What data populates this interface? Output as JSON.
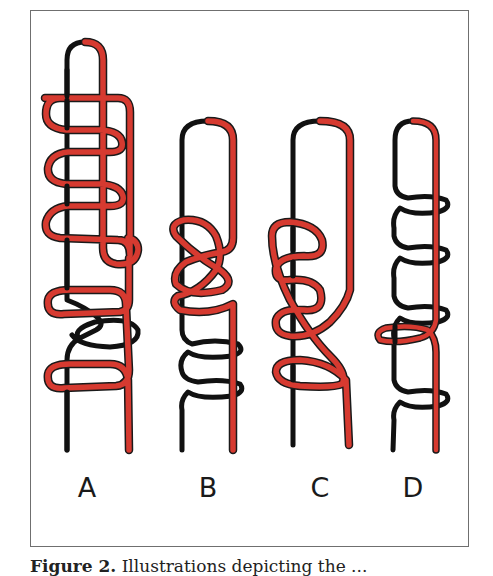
{
  "figure": {
    "panels": [
      {
        "label": "A",
        "x": 87
      },
      {
        "label": "B",
        "x": 208
      },
      {
        "label": "C",
        "x": 320
      },
      {
        "label": "D",
        "x": 413
      }
    ],
    "caption": {
      "number": "Figure 2.",
      "text": "Illustrations depicting the ..."
    },
    "colors": {
      "red_strand": "#d63a30",
      "black_strand": "#111111",
      "outline": "#1a1a1a",
      "frame": "#6f6f6f"
    }
  }
}
